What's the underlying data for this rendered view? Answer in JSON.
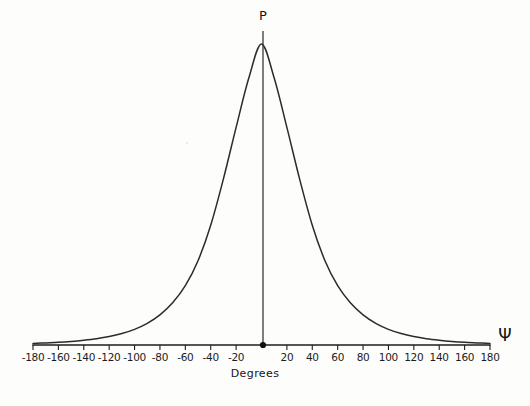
{
  "figure": {
    "background_color": "#fdfdfc",
    "line_color": "#2b2b2b",
    "axis_color": "#1c1c1c",
    "peak_label": "P",
    "variable_label": "Ψ"
  },
  "chart_data": {
    "type": "line",
    "title": "",
    "subtitle": "",
    "xlabel": "Degrees",
    "ylabel": "P",
    "x_variable_symbol": "Ψ",
    "peak_label": "P",
    "grid": false,
    "legend": null,
    "xlim": [
      -180,
      180
    ],
    "ylim": [
      0,
      1
    ],
    "xticks": [
      -180,
      -160,
      -140,
      -120,
      -100,
      -80,
      -60,
      -40,
      -20,
      0,
      20,
      40,
      60,
      80,
      100,
      120,
      140,
      160,
      180
    ],
    "xtick_labels": [
      "-180",
      "-160",
      "-140",
      "-120",
      "-100",
      "-80",
      "-60",
      "-40",
      "-20",
      "0",
      "20",
      "40",
      "60",
      "80",
      "100",
      "120",
      "140",
      "160",
      "180"
    ],
    "yticks": [],
    "ytick_labels": [],
    "annotations": [
      {
        "text": "P",
        "x": 0,
        "y": 1.0,
        "note": "label above peak of vertical axis line"
      },
      {
        "text": "Ψ",
        "x": 195,
        "y": 0,
        "note": "axis variable at right end of baseline"
      },
      {
        "text": "Degrees",
        "x": 0,
        "y": -0.12,
        "note": "x axis title"
      }
    ],
    "markers": [
      {
        "x": 0,
        "y": 0,
        "style": "filled-circle",
        "note": "origin point where vertical line meets baseline"
      }
    ],
    "series": [
      {
        "name": "P",
        "description": "Symmetric bell-shaped probability distribution centered at 0 degrees with broad Lorentzian-like tails decaying to the baseline near +/-180 degrees",
        "x": [
          -180,
          -170,
          -160,
          -150,
          -140,
          -130,
          -120,
          -110,
          -100,
          -90,
          -80,
          -70,
          -60,
          -50,
          -40,
          -30,
          -20,
          -10,
          0,
          10,
          20,
          30,
          40,
          50,
          60,
          70,
          80,
          90,
          100,
          110,
          120,
          130,
          140,
          150,
          160,
          170,
          180
        ],
        "values": [
          0.005,
          0.007,
          0.009,
          0.012,
          0.016,
          0.021,
          0.028,
          0.038,
          0.052,
          0.072,
          0.1,
          0.14,
          0.197,
          0.28,
          0.398,
          0.552,
          0.723,
          0.887,
          1.0,
          0.887,
          0.723,
          0.552,
          0.398,
          0.28,
          0.197,
          0.14,
          0.1,
          0.072,
          0.052,
          0.038,
          0.028,
          0.021,
          0.016,
          0.012,
          0.009,
          0.007,
          0.005
        ]
      }
    ]
  }
}
